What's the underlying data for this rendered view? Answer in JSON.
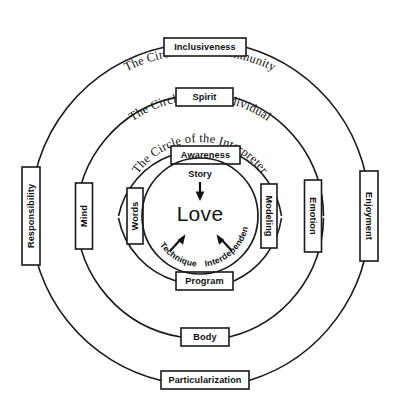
{
  "diagram": {
    "center": {
      "label": "Love"
    },
    "rings": [
      {
        "id": "community",
        "caption": "The Circle of the Community",
        "radius": 170,
        "nodes": {
          "top": "Inclusiveness",
          "left": "Responsibility",
          "right": "Enjoyment",
          "bottom": "Particularization"
        }
      },
      {
        "id": "individual",
        "caption": "The Circle of the Individual",
        "radius": 124,
        "nodes": {
          "top": "Spirit",
          "left": "Mind",
          "right": "Emotion",
          "bottom": "Body"
        }
      },
      {
        "id": "interpreter",
        "caption": "The Circle of the Interpreter",
        "radius": 82,
        "nodes": {
          "top": "Awareness",
          "left": "Words",
          "right": "Modeling",
          "bottom": "Program"
        }
      },
      {
        "id": "core",
        "caption": "",
        "radius": 58,
        "nodes": {
          "top": "",
          "left": "",
          "right": "",
          "bottom": ""
        }
      }
    ],
    "flows": [
      {
        "id": "story",
        "label": "Story",
        "from": "Awareness",
        "to": "Love",
        "direction": "down"
      },
      {
        "id": "technique",
        "label": "Technique",
        "from": "Words",
        "to": "Love",
        "direction": "up-right"
      },
      {
        "id": "interdependence",
        "label": "Interdependence",
        "from": "Modeling",
        "to": "Love",
        "direction": "up-left"
      }
    ],
    "colors": {
      "stroke": "#1a1a1a",
      "text": "#111111",
      "background": "#ffffff",
      "box_fill": "#ffffff"
    }
  }
}
